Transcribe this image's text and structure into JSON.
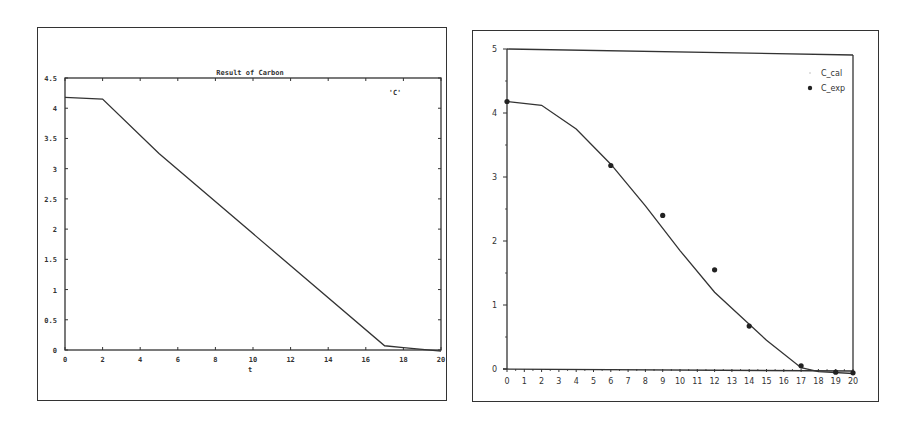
{
  "chart_data": [
    {
      "type": "line",
      "title": "Result of Carbon",
      "xlabel": "t",
      "ylabel": "",
      "xlim": [
        0,
        20
      ],
      "ylim": [
        0,
        4.5
      ],
      "x_ticks": [
        "0",
        "2",
        "4",
        "6",
        "8",
        "10",
        "12",
        "14",
        "16",
        "18",
        "20"
      ],
      "y_ticks": [
        "0",
        "0.5",
        "1",
        "1.5",
        "2",
        "2.5",
        "3",
        "3.5",
        "4",
        "4.5"
      ],
      "grid": false,
      "legend": [
        "'C'"
      ],
      "legend_position": "top-right",
      "series": [
        {
          "name": "'C'",
          "x": [
            0,
            2,
            5,
            17,
            18,
            20
          ],
          "values": [
            4.18,
            4.15,
            3.25,
            0.07,
            0.04,
            -0.02
          ]
        }
      ]
    },
    {
      "type": "line",
      "title": "",
      "xlabel": "",
      "ylabel": "",
      "xlim": [
        0,
        20
      ],
      "ylim": [
        0,
        5
      ],
      "x_ticks": [
        "0",
        "1",
        "2",
        "3",
        "4",
        "5",
        "6",
        "7",
        "8",
        "9",
        "10",
        "11",
        "12",
        "13",
        "14",
        "15",
        "16",
        "17",
        "18",
        "19",
        "20"
      ],
      "y_ticks": [
        "0",
        "1",
        "2",
        "3",
        "4",
        "5"
      ],
      "grid": false,
      "legend": [
        "C_cal",
        "C_exp"
      ],
      "legend_position": "top-right",
      "series": [
        {
          "name": "C_cal",
          "style": "line",
          "x": [
            0,
            2,
            4,
            6,
            8,
            10,
            12,
            13,
            15,
            17,
            18,
            20
          ],
          "values": [
            4.18,
            4.12,
            3.75,
            3.2,
            2.55,
            1.85,
            1.2,
            0.95,
            0.45,
            0.02,
            -0.04,
            -0.07
          ]
        },
        {
          "name": "C_exp",
          "style": "scatter",
          "x": [
            0,
            6,
            9,
            12,
            14,
            17,
            19,
            20
          ],
          "values": [
            4.18,
            3.18,
            2.4,
            1.55,
            0.67,
            0.05,
            -0.05,
            -0.06
          ]
        }
      ]
    }
  ],
  "left": {
    "title": "Result of Carbon",
    "xlabel": "t",
    "legend_label": "'C'"
  },
  "right": {
    "legend_cal": "C_cal",
    "legend_exp": "C_exp"
  }
}
